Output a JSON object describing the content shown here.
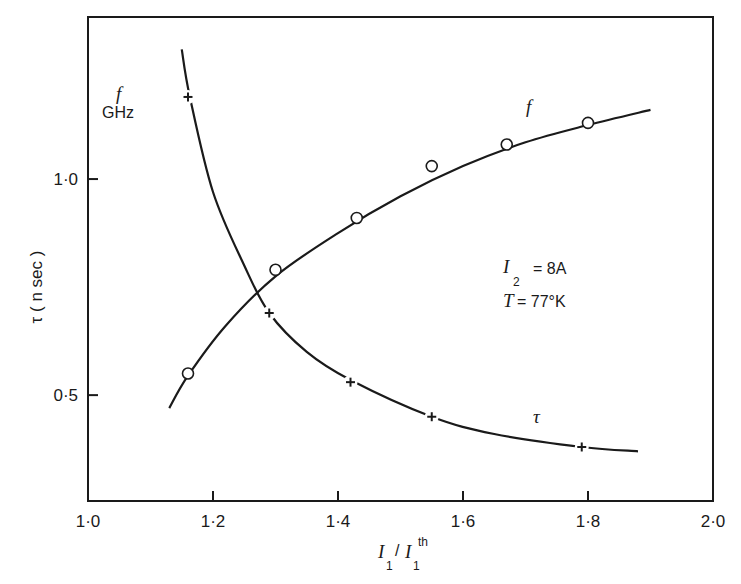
{
  "chart_data": {
    "type": "line",
    "title": "",
    "xlabel": "I1 / I1^th",
    "ylabel": "τ (n sec)",
    "ylabel_secondary": "f GHz",
    "xlim": [
      1.0,
      2.0
    ],
    "ylim": [
      0.255,
      1.375
    ],
    "x_ticks": [
      "1·0",
      "1·2",
      "1·4",
      "1·6",
      "1·8",
      "2·0"
    ],
    "y_ticks": [
      "0·5",
      "1·0"
    ],
    "grid": false,
    "annotations": [
      "I2 = 8A",
      "T = 77°K"
    ],
    "series": [
      {
        "name": "f",
        "unit": "GHz",
        "marker": "open-circle",
        "x": [
          1.16,
          1.3,
          1.43,
          1.55,
          1.67,
          1.8
        ],
        "values": [
          0.55,
          0.79,
          0.91,
          1.03,
          1.08,
          1.13
        ],
        "curve_range": [
          1.13,
          1.9
        ]
      },
      {
        "name": "τ",
        "unit": "n sec",
        "marker": "plus",
        "x": [
          1.16,
          1.29,
          1.42,
          1.55,
          1.79
        ],
        "values": [
          1.19,
          0.69,
          0.53,
          0.45,
          0.38
        ],
        "curve_range": [
          1.15,
          1.88
        ]
      }
    ]
  },
  "labels": {
    "y_axis_label": "τ ( n sec )",
    "secondary_label_symbol": "f",
    "secondary_label_unit": "GHz",
    "x_axis_I": "I",
    "x_axis_sub": "1",
    "x_axis_slash": "/",
    "x_axis_sup": "th",
    "curve_f_label": "f",
    "curve_tau_label": "τ",
    "anno_I": "I",
    "anno_I_sub": "2",
    "anno_I_value": "= 8A",
    "anno_T": "T",
    "anno_T_value": "= 77°K"
  },
  "colors": {
    "ink": "#1a1a1a",
    "background": "#ffffff"
  }
}
